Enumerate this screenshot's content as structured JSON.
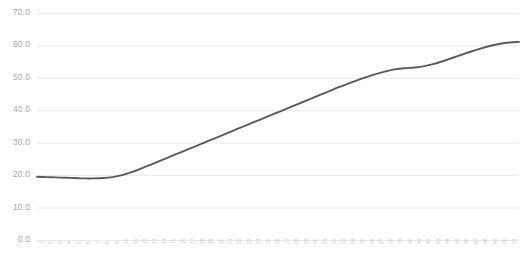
{
  "chart_data": {
    "type": "line",
    "title": "",
    "subtitle": "",
    "xlabel": "",
    "ylabel": "",
    "ylim": [
      0.0,
      70.0
    ],
    "y_ticks": [
      0.0,
      10.0,
      20.0,
      30.0,
      40.0,
      50.0,
      60.0,
      70.0
    ],
    "y_tick_labels": [
      "0.0",
      "10.0",
      "20.0",
      "30.0",
      "40.0",
      "50.0",
      "60.0",
      "70.0"
    ],
    "grid": true,
    "grid_axis": "y",
    "legend": false,
    "legend_position": "none",
    "line_color": "#5a5a5a",
    "grid_color": "#e9e9e9",
    "tick_label_color": "#a8a8a8",
    "x_tick_label_color": "#cccccc",
    "x_tick_label_rotation": -90,
    "x_tick_labels_clipped": true,
    "x": [
      1,
      2,
      3,
      4,
      5,
      6,
      7,
      8,
      9,
      10,
      11,
      12,
      13,
      14,
      15,
      16,
      17,
      18,
      19,
      20,
      21,
      22,
      23,
      24,
      25,
      26,
      27,
      28,
      29,
      30,
      31,
      32,
      33,
      34,
      35,
      36,
      37,
      38,
      39,
      40,
      41,
      42,
      43,
      44,
      45,
      46,
      47,
      48,
      49,
      50,
      51,
      52
    ],
    "categories": [
      "1",
      "2",
      "3",
      "4",
      "5",
      "6",
      "7",
      "8",
      "9",
      "10",
      "11",
      "12",
      "13",
      "14",
      "15",
      "16",
      "17",
      "18",
      "19",
      "20",
      "21",
      "22",
      "23",
      "24",
      "25",
      "26",
      "27",
      "28",
      "29",
      "30",
      "31",
      "32",
      "33",
      "34",
      "35",
      "36",
      "37",
      "38",
      "39",
      "40",
      "41",
      "42",
      "43",
      "44",
      "45",
      "46",
      "47",
      "48",
      "49",
      "50",
      "51",
      "52"
    ],
    "series": [
      {
        "name": "series-1",
        "color": "#5a5a5a",
        "values": [
          19.5,
          19.4,
          19.3,
          19.2,
          19.1,
          19.0,
          19.0,
          19.1,
          19.4,
          20.0,
          20.9,
          22.0,
          23.2,
          24.4,
          25.6,
          26.8,
          28.0,
          29.2,
          30.4,
          31.6,
          32.8,
          34.0,
          35.2,
          36.4,
          37.6,
          38.8,
          40.0,
          41.2,
          42.4,
          43.6,
          44.8,
          46.0,
          47.2,
          48.3,
          49.4,
          50.4,
          51.3,
          52.1,
          52.7,
          53.0,
          53.2,
          53.6,
          54.3,
          55.2,
          56.2,
          57.2,
          58.2,
          59.1,
          59.9,
          60.5,
          60.9,
          61.1
        ]
      }
    ]
  }
}
